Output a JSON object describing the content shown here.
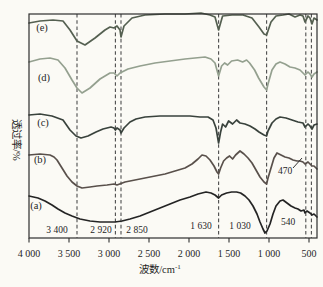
{
  "figure": {
    "width": 323,
    "height": 287,
    "background": "#fbfaf5",
    "frame_color": "#2e2e2e",
    "guide_color": "#4d4d4d",
    "text_color": "#1f1f1f"
  },
  "chart_data": {
    "type": "line",
    "title": "",
    "xlabel_base": "波数/cm",
    "xlabel_exp": "-1",
    "ylabel": "透过率/%",
    "x_axis": {
      "min": 400,
      "max": 4000,
      "reversed": true,
      "ticks": [
        4000,
        3500,
        3000,
        2500,
        2000,
        1500,
        1000,
        500
      ],
      "tick_labels": [
        "4 000",
        "3 500",
        "3 000",
        "2 500",
        "2 000",
        "1 500",
        "1 000",
        "500"
      ]
    },
    "y_axis": {
      "label": "透过率/%",
      "units": "arbitrary offset units (stacked transmittance spectra, no numeric scale shown; y given as image pixel, lower value = higher transmittance)"
    },
    "dashed_guides": [
      3400,
      2920,
      2850,
      1630,
      1030,
      540,
      470
    ],
    "band_annotations": [
      {
        "text": "3 400",
        "x": 57,
        "y": 233
      },
      {
        "text": "2 920",
        "x": 101,
        "y": 233
      },
      {
        "text": "2 850",
        "x": 137,
        "y": 233
      },
      {
        "text": "1 630",
        "x": 201,
        "y": 229
      },
      {
        "text": "1 030",
        "x": 240,
        "y": 229
      },
      {
        "text": "540",
        "x": 288,
        "y": 225
      },
      {
        "text": "470",
        "x": 285,
        "y": 174,
        "leader": [
          293,
          168,
          302,
          158
        ]
      }
    ],
    "series": [
      {
        "id": "e",
        "name": "(e)",
        "color": "#556051",
        "label_x": 42,
        "label_y": 31,
        "points": [
          [
            4000,
            23
          ],
          [
            3863,
            21
          ],
          [
            3700,
            20
          ],
          [
            3575,
            21
          ],
          [
            3488,
            30
          ],
          [
            3400,
            41
          ],
          [
            3300,
            45
          ],
          [
            3175,
            38
          ],
          [
            3050,
            30
          ],
          [
            2988,
            27
          ],
          [
            2938,
            28
          ],
          [
            2900,
            26
          ],
          [
            2863,
            30
          ],
          [
            2850,
            37
          ],
          [
            2813,
            26
          ],
          [
            2713,
            18
          ],
          [
            2550,
            15
          ],
          [
            2300,
            14
          ],
          [
            2050,
            14
          ],
          [
            1850,
            13
          ],
          [
            1738,
            15
          ],
          [
            1675,
            17
          ],
          [
            1630,
            30
          ],
          [
            1580,
            16
          ],
          [
            1463,
            15
          ],
          [
            1325,
            15
          ],
          [
            1213,
            18
          ],
          [
            1125,
            27
          ],
          [
            1063,
            34
          ],
          [
            1030,
            35
          ],
          [
            975,
            22
          ],
          [
            913,
            16
          ],
          [
            825,
            15
          ],
          [
            750,
            14
          ],
          [
            675,
            17
          ],
          [
            613,
            15
          ],
          [
            575,
            16
          ],
          [
            550,
            22
          ],
          [
            513,
            16
          ],
          [
            488,
            18
          ],
          [
            463,
            24
          ],
          [
            438,
            18
          ],
          [
            400,
            20
          ]
        ]
      },
      {
        "id": "d",
        "name": "(d)",
        "color": "#94a08f",
        "label_x": 44,
        "label_y": 81,
        "points": [
          [
            4000,
            62
          ],
          [
            3863,
            59
          ],
          [
            3738,
            58
          ],
          [
            3638,
            60
          ],
          [
            3550,
            68
          ],
          [
            3463,
            80
          ],
          [
            3400,
            88
          ],
          [
            3338,
            93
          ],
          [
            3238,
            88
          ],
          [
            3113,
            79
          ],
          [
            2988,
            73
          ],
          [
            2938,
            73
          ],
          [
            2900,
            76
          ],
          [
            2863,
            73
          ],
          [
            2763,
            69
          ],
          [
            2613,
            66
          ],
          [
            2425,
            63
          ],
          [
            2238,
            61
          ],
          [
            2050,
            59
          ],
          [
            1925,
            58
          ],
          [
            1800,
            57
          ],
          [
            1725,
            59
          ],
          [
            1675,
            63
          ],
          [
            1630,
            76
          ],
          [
            1593,
            66
          ],
          [
            1555,
            63
          ],
          [
            1518,
            65
          ],
          [
            1468,
            61
          ],
          [
            1393,
            60
          ],
          [
            1330,
            62
          ],
          [
            1280,
            60
          ],
          [
            1243,
            63
          ],
          [
            1180,
            70
          ],
          [
            1130,
            78
          ],
          [
            1063,
            87
          ],
          [
            1030,
            90
          ],
          [
            1013,
            84
          ],
          [
            963,
            70
          ],
          [
            913,
            64
          ],
          [
            863,
            62
          ],
          [
            800,
            64
          ],
          [
            738,
            67
          ],
          [
            675,
            68
          ],
          [
            613,
            70
          ],
          [
            550,
            75
          ],
          [
            513,
            72
          ],
          [
            488,
            74
          ],
          [
            463,
            77
          ],
          [
            438,
            74
          ],
          [
            400,
            72
          ]
        ]
      },
      {
        "id": "c",
        "name": "(c)",
        "color": "#39423c",
        "label_x": 43,
        "label_y": 126,
        "points": [
          [
            4000,
            115
          ],
          [
            3863,
            114
          ],
          [
            3713,
            116
          ],
          [
            3575,
            120
          ],
          [
            3488,
            130
          ],
          [
            3413,
            136
          ],
          [
            3350,
            138
          ],
          [
            3263,
            136
          ],
          [
            3163,
            132
          ],
          [
            3075,
            129
          ],
          [
            2975,
            127
          ],
          [
            2938,
            128
          ],
          [
            2920,
            130
          ],
          [
            2900,
            128
          ],
          [
            2863,
            130
          ],
          [
            2850,
            133
          ],
          [
            2813,
            128
          ],
          [
            2738,
            122
          ],
          [
            2663,
            119
          ],
          [
            2550,
            117
          ],
          [
            2363,
            116
          ],
          [
            2175,
            116
          ],
          [
            1988,
            116
          ],
          [
            1863,
            117
          ],
          [
            1763,
            117
          ],
          [
            1700,
            120
          ],
          [
            1663,
            128
          ],
          [
            1630,
            143
          ],
          [
            1605,
            132
          ],
          [
            1580,
            124
          ],
          [
            1543,
            127
          ],
          [
            1505,
            121
          ],
          [
            1455,
            124
          ],
          [
            1405,
            120
          ],
          [
            1363,
            123
          ],
          [
            1300,
            124
          ],
          [
            1238,
            126
          ],
          [
            1175,
            129
          ],
          [
            1125,
            132
          ],
          [
            1063,
            135
          ],
          [
            1030,
            136
          ],
          [
            1013,
            131
          ],
          [
            963,
            123
          ],
          [
            913,
            119
          ],
          [
            863,
            117
          ],
          [
            788,
            118
          ],
          [
            713,
            120
          ],
          [
            638,
            122
          ],
          [
            575,
            123
          ],
          [
            550,
            127
          ],
          [
            513,
            124
          ],
          [
            488,
            126
          ],
          [
            463,
            129
          ],
          [
            438,
            125
          ],
          [
            400,
            124
          ]
        ]
      },
      {
        "id": "b",
        "name": "(b)",
        "color": "#59504b",
        "label_x": 40,
        "label_y": 163,
        "points": [
          [
            4000,
            155
          ],
          [
            3863,
            154
          ],
          [
            3738,
            155
          ],
          [
            3688,
            157
          ],
          [
            3650,
            160
          ],
          [
            3588,
            168
          ],
          [
            3525,
            176
          ],
          [
            3463,
            182
          ],
          [
            3400,
            186
          ],
          [
            3338,
            188
          ],
          [
            3238,
            187
          ],
          [
            3150,
            186
          ],
          [
            3025,
            185
          ],
          [
            2938,
            184
          ],
          [
            2900,
            185
          ],
          [
            2800,
            182
          ],
          [
            2675,
            180
          ],
          [
            2550,
            178
          ],
          [
            2425,
            176
          ],
          [
            2300,
            174
          ],
          [
            2175,
            171
          ],
          [
            2050,
            168
          ],
          [
            1963,
            164
          ],
          [
            1888,
            159
          ],
          [
            1838,
            155
          ],
          [
            1788,
            156
          ],
          [
            1738,
            160
          ],
          [
            1688,
            166
          ],
          [
            1650,
            172
          ],
          [
            1630,
            174
          ],
          [
            1605,
            168
          ],
          [
            1568,
            161
          ],
          [
            1530,
            158
          ],
          [
            1493,
            156
          ],
          [
            1455,
            159
          ],
          [
            1418,
            155
          ],
          [
            1363,
            151
          ],
          [
            1313,
            154
          ],
          [
            1263,
            158
          ],
          [
            1213,
            163
          ],
          [
            1163,
            170
          ],
          [
            1113,
            177
          ],
          [
            1063,
            182
          ],
          [
            1030,
            184
          ],
          [
            1013,
            178
          ],
          [
            975,
            168
          ],
          [
            938,
            158
          ],
          [
            900,
            153
          ],
          [
            850,
            155
          ],
          [
            800,
            157
          ],
          [
            750,
            158
          ],
          [
            700,
            160
          ],
          [
            650,
            161
          ],
          [
            613,
            161
          ],
          [
            575,
            162
          ],
          [
            550,
            164
          ],
          [
            513,
            162
          ],
          [
            488,
            164
          ],
          [
            463,
            166
          ],
          [
            438,
            166
          ],
          [
            400,
            169
          ]
        ]
      },
      {
        "id": "a",
        "name": "(a)",
        "color": "#242424",
        "label_x": 36,
        "label_y": 209,
        "points": [
          [
            4000,
            196
          ],
          [
            3888,
            198
          ],
          [
            3800,
            201
          ],
          [
            3713,
            205
          ],
          [
            3638,
            209
          ],
          [
            3550,
            213
          ],
          [
            3463,
            216
          ],
          [
            3363,
            219
          ],
          [
            3238,
            221
          ],
          [
            3113,
            222
          ],
          [
            3013,
            222
          ],
          [
            2925,
            222
          ],
          [
            2838,
            221
          ],
          [
            2738,
            219
          ],
          [
            2613,
            216
          ],
          [
            2488,
            212
          ],
          [
            2363,
            208
          ],
          [
            2238,
            204
          ],
          [
            2113,
            200
          ],
          [
            1988,
            197
          ],
          [
            1888,
            194
          ],
          [
            1788,
            192
          ],
          [
            1725,
            193
          ],
          [
            1675,
            195
          ],
          [
            1630,
            198
          ],
          [
            1593,
            195
          ],
          [
            1530,
            193
          ],
          [
            1468,
            192
          ],
          [
            1405,
            192
          ],
          [
            1355,
            193
          ],
          [
            1300,
            196
          ],
          [
            1250,
            200
          ],
          [
            1200,
            206
          ],
          [
            1150,
            214
          ],
          [
            1113,
            222
          ],
          [
            1075,
            229
          ],
          [
            1050,
            233
          ],
          [
            1025,
            231
          ],
          [
            988,
            224
          ],
          [
            950,
            214
          ],
          [
            913,
            206
          ],
          [
            863,
            201
          ],
          [
            825,
            200
          ],
          [
            775,
            203
          ],
          [
            725,
            206
          ],
          [
            675,
            208
          ],
          [
            638,
            209
          ],
          [
            600,
            211
          ],
          [
            563,
            210
          ],
          [
            550,
            213
          ],
          [
            525,
            211
          ],
          [
            488,
            213
          ],
          [
            463,
            215
          ],
          [
            438,
            214
          ],
          [
            400,
            217
          ]
        ]
      }
    ],
    "plot_area": {
      "x0": 29,
      "x1": 317,
      "y0": 14,
      "y1": 238
    },
    "legend_position": "none",
    "grid": false
  }
}
